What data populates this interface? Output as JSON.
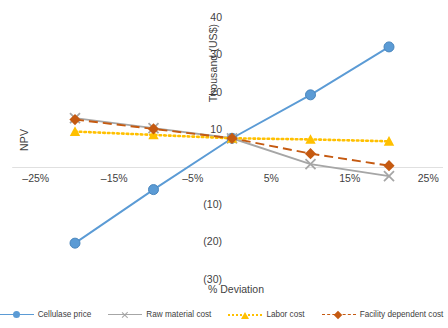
{
  "chart_data": {
    "type": "line",
    "title": "",
    "xlabel": "% Deviation",
    "ylabel": "NPV",
    "y_axis_unit_label": "Thousand (US$)",
    "x": [
      -20,
      -10,
      0,
      10,
      20
    ],
    "xticklabels": [
      "–25%",
      "–15%",
      "–5%",
      "5%",
      "15%",
      "25%"
    ],
    "xtickvalues": [
      -25,
      -15,
      -5,
      5,
      15,
      25
    ],
    "yticklabels": [
      "40",
      "30",
      "20",
      "10",
      "(10)",
      "(20)",
      "(30)"
    ],
    "ytickvalues": [
      40,
      30,
      20,
      10,
      -10,
      -20,
      -30
    ],
    "xlim": [
      -28,
      28
    ],
    "ylim": [
      -33,
      43
    ],
    "grid": false,
    "legend_position": "bottom",
    "series": [
      {
        "name": "Cellulase price",
        "color": "#5b9bd5",
        "marker": "circle",
        "linestyle": "solid",
        "values": [
          -20.2,
          -5.9,
          7.8,
          19.4,
          32.2
        ]
      },
      {
        "name": "Raw material cost",
        "color": "#a6a6a6",
        "marker": "x",
        "linestyle": "solid",
        "values": [
          13.2,
          10.5,
          7.8,
          0.9,
          -2.3
        ]
      },
      {
        "name": "Labor cost",
        "color": "#ffc000",
        "marker": "triangle",
        "linestyle": "dotted",
        "values": [
          9.6,
          8.7,
          7.8,
          7.5,
          7.0
        ]
      },
      {
        "name": "Facility dependent cost",
        "color": "#c55a11",
        "marker": "diamond",
        "linestyle": "dashed",
        "values": [
          12.8,
          10.3,
          7.8,
          3.7,
          0.5
        ]
      }
    ]
  }
}
